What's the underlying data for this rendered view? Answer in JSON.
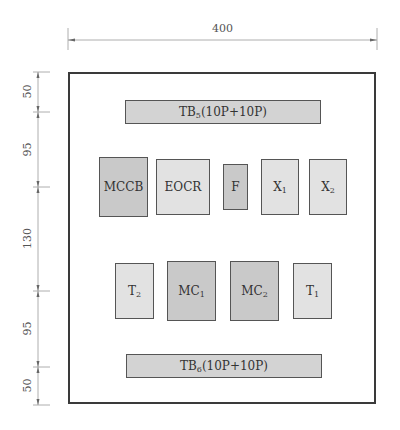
{
  "dimensions": {
    "width_label": "400",
    "vertical_labels": [
      "50",
      "95",
      "130",
      "95",
      "50"
    ]
  },
  "terminal_blocks": {
    "top": {
      "name": "TB",
      "sub": "5",
      "suffix": "(10P+10P)"
    },
    "bottom": {
      "name": "TB",
      "sub": "6",
      "suffix": "(10P+10P)"
    }
  },
  "row1": [
    {
      "name": "MCCB",
      "sub": ""
    },
    {
      "name": "EOCR",
      "sub": ""
    },
    {
      "name": "F",
      "sub": ""
    },
    {
      "name": "X",
      "sub": "1"
    },
    {
      "name": "X",
      "sub": "2"
    }
  ],
  "row2": [
    {
      "name": "T",
      "sub": "2"
    },
    {
      "name": "MC",
      "sub": "1"
    },
    {
      "name": "MC",
      "sub": "2"
    },
    {
      "name": "T",
      "sub": "1"
    }
  ],
  "colors": {
    "dark_fill": "#c9c9c9",
    "light_fill": "#e2e2e2",
    "border": "#3a3a3a"
  }
}
